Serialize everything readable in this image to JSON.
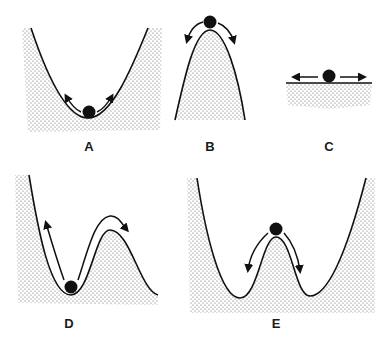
{
  "figure": {
    "panels": [
      {
        "id": "A",
        "label": "A",
        "description": "ball in valley (stable equilibrium)"
      },
      {
        "id": "B",
        "label": "B",
        "description": "ball on peak (unstable equilibrium)"
      },
      {
        "id": "C",
        "label": "C",
        "description": "ball on flat surface (neutral equilibrium)"
      },
      {
        "id": "D",
        "label": "D",
        "description": "ball in valley next to a hill (metastable)"
      },
      {
        "id": "E",
        "label": "E",
        "description": "ball on peak between two valleys (double well)"
      }
    ],
    "colors": {
      "stipple": "#555555",
      "line": "#111111",
      "ball": "#111111",
      "background": "#ffffff"
    }
  }
}
